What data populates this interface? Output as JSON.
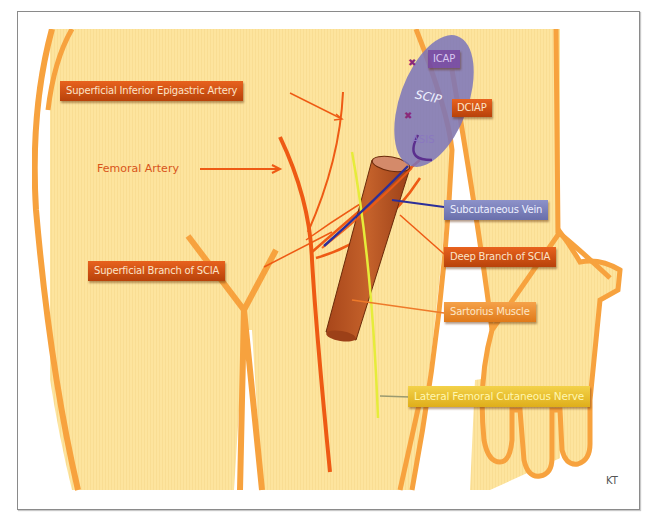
{
  "diagram": {
    "type": "anatomical illustration",
    "colors": {
      "skin_fill": "#fde49e",
      "outline": "#f7a23e",
      "artery": "#ee5a14",
      "vein": "#2c2f9a",
      "nerve": "#e6ec3a",
      "muscle": "#b5521f",
      "scip_region": "#7a74bb"
    },
    "labels": {
      "siea": "Superficial Inferior Epigastric Artery",
      "femoral_artery": "Femoral Artery",
      "icap": "ICAP",
      "scip": "SCIP",
      "dciap": "DCIAP",
      "asis": "ASIS",
      "subcutaneous_vein": "Subcutaneous Vein",
      "superficial_branch_scia": "Superficial Branch of SCIA",
      "deep_branch_scia": "Deep Branch of SCIA",
      "sartorius_muscle": "Sartorius Muscle",
      "lfcn": "Lateral Femoral Cutaneous Nerve"
    },
    "signature": "KT"
  }
}
